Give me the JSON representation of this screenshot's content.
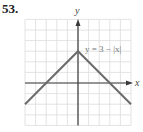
{
  "problem_number": "53.",
  "chart_data": {
    "type": "line",
    "title": "",
    "annotation": "y = 3 − |x|",
    "xlabel": "x",
    "ylabel": "y",
    "xlim": [
      -5,
      5
    ],
    "ylim": [
      -4,
      6
    ],
    "grid": true,
    "series": [
      {
        "name": "y = 3 − |x|",
        "x": [
          -5,
          -3,
          0,
          3,
          5
        ],
        "values": [
          -2,
          0,
          3,
          0,
          -2
        ]
      }
    ]
  }
}
